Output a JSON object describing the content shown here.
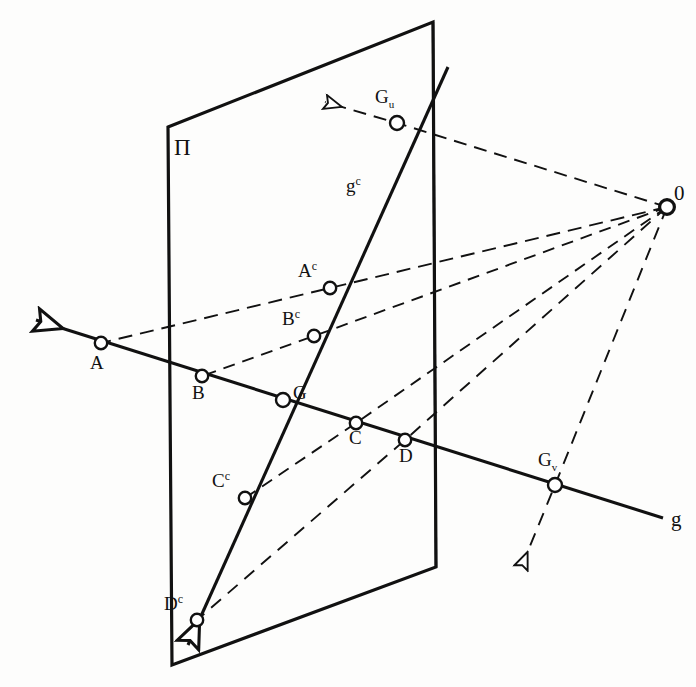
{
  "figure": {
    "type": "geometric-projection-diagram",
    "background_color": "#fdfdfc",
    "ink_color": "#111111"
  },
  "labels": {
    "plane": "Π",
    "projection_centre": "0",
    "line_g": "g",
    "line_gc": "g",
    "line_gc_sup": "c",
    "point_A": "A",
    "point_B": "B",
    "point_C": "C",
    "point_D": "D",
    "point_G": "G",
    "point_Ac": "A",
    "point_Bc": "B",
    "point_Cc": "C",
    "point_Dc": "D",
    "sup_c": "c",
    "point_Gu": "G",
    "sub_u": "u",
    "point_Gv": "G",
    "sub_v": "v"
  },
  "geometry": {
    "plane_polygon": "168,127 433,22 436,567 172,665",
    "plane_vertical_edge": {
      "x1": 433,
      "y1": 22,
      "x2": 436,
      "y2": 567
    },
    "projection_centre_point": {
      "x": 667,
      "y": 207
    },
    "line_g": {
      "start": {
        "x": 36,
        "y": 320
      },
      "end": {
        "x": 663,
        "y": 518
      },
      "arrow_at_start": true
    },
    "line_gc": {
      "start": {
        "x": 448,
        "y": 67
      },
      "end": {
        "x": 188,
        "y": 645
      },
      "arrow_at_end": true
    },
    "points": [
      {
        "name": "A",
        "x": 101,
        "y": 343
      },
      {
        "name": "B",
        "x": 202,
        "y": 376
      },
      {
        "name": "G",
        "x": 283,
        "y": 400
      },
      {
        "name": "C",
        "x": 356,
        "y": 423
      },
      {
        "name": "D",
        "x": 405,
        "y": 440
      },
      {
        "name": "Gv",
        "x": 555,
        "y": 485
      },
      {
        "name": "Gu",
        "x": 397,
        "y": 123
      },
      {
        "name": "Ac",
        "x": 330,
        "y": 288
      },
      {
        "name": "Bc",
        "x": 314,
        "y": 336
      },
      {
        "name": "Cc",
        "x": 245,
        "y": 498
      },
      {
        "name": "Dc",
        "x": 197,
        "y": 620
      }
    ],
    "projection_rays": [
      {
        "name": "ray-O-Gu-arrow",
        "path": "667,207 397,123 325,102",
        "arrow": true
      },
      {
        "name": "ray-O-Ac-A",
        "path": "667,207 330,288 101,343",
        "arrow": false
      },
      {
        "name": "ray-O-Bc-B",
        "path": "667,207 314,336 202,376",
        "arrow": false
      },
      {
        "name": "ray-O-Cc",
        "path": "667,207 356,423 245,498",
        "arrow": false
      },
      {
        "name": "ray-O-Dc",
        "path": "667,207 405,440 197,620",
        "arrow": false
      },
      {
        "name": "ray-O-Gv-arrow",
        "path": "667,207 555,485 521,568",
        "arrow": true
      }
    ]
  },
  "label_positions": {
    "plane": {
      "x": 174,
      "y": 136
    },
    "centre": {
      "x": 674,
      "y": 183
    },
    "g": {
      "x": 671,
      "y": 509
    },
    "gc": {
      "x": 346,
      "y": 176
    },
    "A": {
      "x": 90,
      "y": 353
    },
    "B": {
      "x": 192,
      "y": 383
    },
    "G": {
      "x": 293,
      "y": 383
    },
    "C": {
      "x": 349,
      "y": 428
    },
    "D": {
      "x": 399,
      "y": 446
    },
    "Gv": {
      "x": 538,
      "y": 450
    },
    "Gu": {
      "x": 375,
      "y": 87
    },
    "Ac": {
      "x": 298,
      "y": 261
    },
    "Bc": {
      "x": 282,
      "y": 309
    },
    "Cc": {
      "x": 212,
      "y": 471
    },
    "Dc": {
      "x": 164,
      "y": 594
    }
  }
}
